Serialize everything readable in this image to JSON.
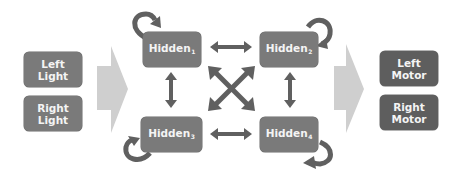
{
  "diagram": {
    "inputs": [
      {
        "line1": "Left",
        "line2": "Light"
      },
      {
        "line1": "Right",
        "line2": "Light"
      }
    ],
    "hidden": [
      {
        "label": "Hidden",
        "index": "1"
      },
      {
        "label": "Hidden",
        "index": "2"
      },
      {
        "label": "Hidden",
        "index": "3"
      },
      {
        "label": "Hidden",
        "index": "4"
      }
    ],
    "outputs": [
      {
        "line1": "Left",
        "line2": "Motor"
      },
      {
        "line1": "Right",
        "line2": "Motor"
      }
    ],
    "connections": {
      "input_to_hidden": "one-way",
      "hidden_to_output": "one-way",
      "hidden_pairs": "bidirectional",
      "self_loops": "recurrent"
    },
    "colors": {
      "node_fill": "#7a7a7a",
      "motor_fill": "#5e5e5e",
      "arrow_dark": "#606060",
      "arrow_light": "#cfcfcf"
    }
  }
}
